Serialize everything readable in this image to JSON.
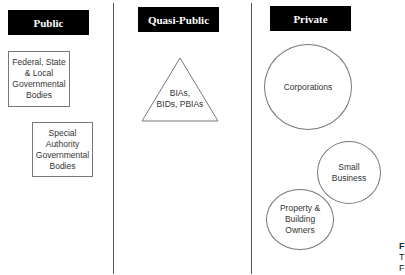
{
  "columns": [
    {
      "header": "Public"
    },
    {
      "header": "Quasi-Public"
    },
    {
      "header": "Private"
    }
  ],
  "public_boxes": [
    {
      "lines": [
        "Federal, State",
        "& Local",
        "Governmental",
        "Bodies"
      ]
    },
    {
      "lines": [
        "Special",
        "Authority",
        "Governmental",
        "Bodies"
      ]
    }
  ],
  "quasi_public_triangle": {
    "lines": [
      "BIAs,",
      "BIDs, PBIAs"
    ]
  },
  "private_circles": [
    {
      "lines": [
        "Corporations"
      ]
    },
    {
      "lines": [
        "Small",
        "Business"
      ]
    },
    {
      "lines": [
        "Property &",
        "Building",
        "Owners"
      ]
    }
  ],
  "cut_off_text": {
    "lines": [
      "F",
      "T",
      "F"
    ]
  },
  "colors": {
    "header_bg": "#000000",
    "header_text": "#ffffff",
    "outline": "#777777",
    "divider": "#555555"
  }
}
